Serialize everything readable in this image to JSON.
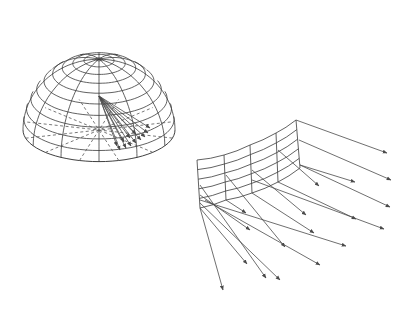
{
  "figure": {
    "width": 411,
    "height": 309,
    "background": "#ffffff",
    "line_color": "#3a3a3a"
  },
  "hemisphere": {
    "label": "hemisphere-wireframe",
    "center": [
      99,
      130
    ],
    "radius_x": 76,
    "radius_y": 113,
    "tilt_y": 0.28,
    "pole": [
      97,
      34
    ],
    "latitude_rings": 10,
    "longitude_lines": 12,
    "fan_origin": [
      99,
      96
    ],
    "fan_arrows": [
      [
        120,
        150
      ],
      [
        126,
        148
      ],
      [
        131,
        146
      ],
      [
        136,
        143
      ],
      [
        141,
        140
      ],
      [
        145,
        137
      ],
      [
        148,
        133
      ],
      [
        150,
        128
      ],
      [
        117,
        146
      ],
      [
        124,
        142
      ],
      [
        130,
        138
      ],
      [
        136,
        134
      ]
    ]
  },
  "patch": {
    "label": "curved-surface-patch",
    "columns": [
      {
        "top": [
          197,
          160
        ],
        "bottom": [
          200,
          208
        ]
      },
      {
        "top": [
          224,
          155
        ],
        "bottom": [
          226,
          200
        ]
      },
      {
        "top": [
          250,
          145
        ],
        "bottom": [
          252,
          193
        ]
      },
      {
        "top": [
          276,
          133
        ],
        "bottom": [
          278,
          182
        ]
      },
      {
        "top": [
          296,
          120
        ],
        "bottom": [
          300,
          168
        ]
      }
    ],
    "rows": 6,
    "arrows": [
      {
        "from": [
          296,
          120
        ],
        "to": [
          387,
          153
        ]
      },
      {
        "from": [
          299,
          140
        ],
        "to": [
          391,
          180
        ]
      },
      {
        "from": [
          300,
          165
        ],
        "to": [
          355,
          182
        ]
      },
      {
        "from": [
          300,
          165
        ],
        "to": [
          390,
          207
        ]
      },
      {
        "from": [
          278,
          150
        ],
        "to": [
          319,
          186
        ]
      },
      {
        "from": [
          278,
          182
        ],
        "to": [
          356,
          219
        ]
      },
      {
        "from": [
          252,
          170
        ],
        "to": [
          306,
          215
        ]
      },
      {
        "from": [
          252,
          193
        ],
        "to": [
          314,
          233
        ]
      },
      {
        "from": [
          226,
          175
        ],
        "to": [
          285,
          247
        ]
      },
      {
        "from": [
          226,
          200
        ],
        "to": [
          246,
          213
        ]
      },
      {
        "from": [
          200,
          185
        ],
        "to": [
          266,
          278
        ]
      },
      {
        "from": [
          200,
          208
        ],
        "to": [
          247,
          264
        ]
      },
      {
        "from": [
          200,
          195
        ],
        "to": [
          250,
          230
        ]
      },
      {
        "from": [
          205,
          200
        ],
        "to": [
          320,
          265
        ]
      },
      {
        "from": [
          200,
          208
        ],
        "to": [
          223,
          290
        ]
      },
      {
        "from": [
          200,
          200
        ],
        "to": [
          346,
          246
        ]
      },
      {
        "from": [
          200,
          203
        ],
        "to": [
          280,
          280
        ]
      },
      {
        "from": [
          252,
          180
        ],
        "to": [
          384,
          229
        ]
      }
    ]
  }
}
